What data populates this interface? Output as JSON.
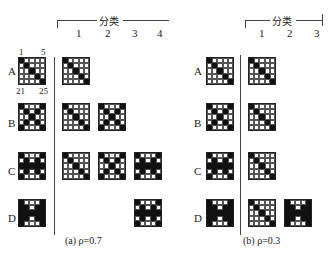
{
  "panel_a": {
    "header": "分类",
    "class_labels": [
      "1",
      "2",
      "3",
      "4"
    ],
    "row_labels": [
      "A",
      "B",
      "C",
      "D"
    ],
    "corner_labels": {
      "top_left": "1",
      "top_right": "5",
      "bottom_left": "21",
      "bottom_right": "25"
    },
    "caption": "(a) ρ=0.7"
  },
  "panel_b": {
    "header": "分类",
    "class_labels": [
      "1",
      "2",
      "3"
    ],
    "row_labels": [
      "A",
      "B",
      "C",
      "D"
    ],
    "caption": "(b) ρ=0.3"
  },
  "patterns": {
    "A": [
      1,
      0,
      0,
      0,
      0,
      0,
      1,
      0,
      0,
      0,
      0,
      0,
      1,
      0,
      0,
      0,
      0,
      0,
      1,
      0,
      0,
      0,
      0,
      0,
      1
    ],
    "B": [
      1,
      0,
      0,
      0,
      1,
      0,
      1,
      0,
      1,
      0,
      0,
      0,
      1,
      0,
      0,
      0,
      1,
      0,
      1,
      0,
      1,
      0,
      0,
      0,
      1
    ],
    "C": [
      1,
      0,
      0,
      0,
      1,
      0,
      1,
      0,
      1,
      0,
      1,
      1,
      1,
      1,
      1,
      0,
      1,
      0,
      1,
      0,
      1,
      0,
      0,
      0,
      1
    ],
    "D": [
      1,
      0,
      0,
      0,
      1,
      1,
      1,
      0,
      1,
      1,
      1,
      1,
      1,
      1,
      1,
      1,
      1,
      0,
      1,
      1,
      1,
      0,
      0,
      0,
      1
    ]
  },
  "layout": {
    "a_inputs": [
      [
        "A",
        18,
        57
      ],
      [
        "B",
        18,
        103
      ],
      [
        "C",
        18,
        152
      ],
      [
        "D",
        18,
        199
      ]
    ],
    "a_cells": [
      [
        "A",
        62,
        57
      ],
      [
        "A",
        62,
        103
      ],
      [
        "B",
        98,
        103
      ],
      [
        "A",
        62,
        152
      ],
      [
        "B",
        98,
        152
      ],
      [
        "C",
        134,
        152
      ],
      [
        "C",
        134,
        199
      ]
    ],
    "b_inputs": [
      [
        "A",
        206,
        57
      ],
      [
        "B",
        206,
        103
      ],
      [
        "C",
        206,
        152
      ],
      [
        "D",
        206,
        199
      ]
    ],
    "b_cells": [
      [
        "A",
        248,
        57
      ],
      [
        "A",
        248,
        103
      ],
      [
        "A",
        248,
        152
      ],
      [
        "A",
        248,
        199
      ],
      [
        "D",
        284,
        199
      ]
    ]
  }
}
